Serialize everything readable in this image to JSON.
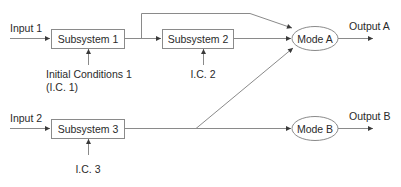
{
  "diagram": {
    "type": "block-diagram",
    "colors": {
      "line": "#8a8a8a",
      "text": "#2a2a2a",
      "background": "#ffffff"
    },
    "inputs": [
      {
        "id": "input1",
        "label": "Input 1"
      },
      {
        "id": "input2",
        "label": "Input 2"
      }
    ],
    "subsystems": [
      {
        "id": "sub1",
        "label": "Subsystem 1"
      },
      {
        "id": "sub2",
        "label": "Subsystem 2"
      },
      {
        "id": "sub3",
        "label": "Subsystem 3"
      }
    ],
    "initial_conditions": [
      {
        "id": "ic1",
        "line1": "Initial Conditions 1",
        "line2": "(I.C. 1)",
        "target": "sub1"
      },
      {
        "id": "ic2",
        "line1": "I.C. 2",
        "target": "sub2"
      },
      {
        "id": "ic3",
        "line1": "I.C. 3",
        "target": "sub3"
      }
    ],
    "modes": [
      {
        "id": "modeA",
        "label": "Mode A"
      },
      {
        "id": "modeB",
        "label": "Mode B"
      }
    ],
    "outputs": [
      {
        "id": "outA",
        "label": "Output A",
        "source": "modeA"
      },
      {
        "id": "outB",
        "label": "Output B",
        "source": "modeB"
      }
    ],
    "connections": [
      {
        "from": "input1",
        "to": "sub1"
      },
      {
        "from": "sub1",
        "to": "sub2"
      },
      {
        "from": "sub1",
        "to": "modeA",
        "note": "bypass branch over Subsystem 2"
      },
      {
        "from": "sub2",
        "to": "modeA"
      },
      {
        "from": "input2",
        "to": "sub3"
      },
      {
        "from": "sub3",
        "to": "modeB"
      },
      {
        "from": "sub3",
        "to": "modeA",
        "note": "diagonal branch"
      },
      {
        "from": "modeA",
        "to": "outA"
      },
      {
        "from": "modeB",
        "to": "outB"
      }
    ]
  }
}
